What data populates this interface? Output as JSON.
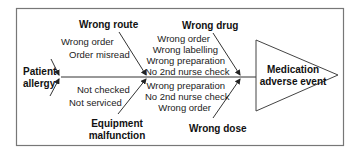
{
  "diagram": {
    "type": "fishbone",
    "effect": {
      "line1": "Medication",
      "line2": "adverse event"
    },
    "categories": {
      "patient_allergy": {
        "line1": "Patient",
        "line2": "allergy",
        "causes": []
      },
      "wrong_route": {
        "title": "Wrong route",
        "causes": [
          "Wrong order",
          "Order misread"
        ]
      },
      "equipment_malfunction": {
        "line1": "Equipment",
        "line2": "malfunction",
        "causes": [
          "Not checked",
          "Not serviced"
        ]
      },
      "wrong_drug": {
        "title": "Wrong drug",
        "causes": [
          "Wrong order",
          "Wrong labelling",
          "Wrong preparation",
          "No 2nd nurse check"
        ]
      },
      "wrong_dose": {
        "title": "Wrong dose",
        "causes": [
          "Wrong preparation",
          "No 2nd nurse check",
          "Wrong order"
        ]
      }
    },
    "colors": {
      "line": "#333333",
      "frame": "#777777",
      "text": "#222222",
      "background": "#ffffff"
    }
  }
}
